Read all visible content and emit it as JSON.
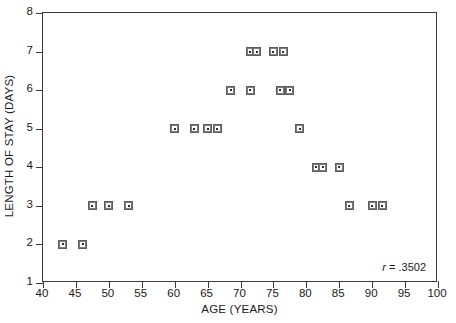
{
  "chart_data": {
    "type": "scatter",
    "title": "",
    "xlabel": "AGE (YEARS)",
    "ylabel": "LENGTH OF STAY (DAYS)",
    "xlim": [
      40,
      100
    ],
    "ylim": [
      1,
      8
    ],
    "xticks": [
      40,
      45,
      50,
      55,
      60,
      65,
      70,
      75,
      80,
      85,
      90,
      95,
      100
    ],
    "yticks": [
      1,
      2,
      3,
      4,
      5,
      6,
      7,
      8
    ],
    "xtick_labels": [
      "40",
      "45",
      "50",
      "55",
      "60",
      "65",
      "70",
      "75",
      "80",
      "85",
      "90",
      "95",
      "100"
    ],
    "ytick_labels": [
      "1",
      "2",
      "3",
      "4",
      "5",
      "6",
      "7",
      "8"
    ],
    "grid": false,
    "legend": false,
    "marker": "square-dot",
    "marker_color": "#7d7d7d",
    "frame_color": "#3a3a3a",
    "background": "#ffffff",
    "annotations": [
      {
        "text": "r = .3502",
        "symbol": "r",
        "value": ".3502",
        "position": "bottom-right"
      }
    ],
    "points": [
      {
        "x": 43,
        "y": 2
      },
      {
        "x": 46,
        "y": 2
      },
      {
        "x": 47.5,
        "y": 3
      },
      {
        "x": 50,
        "y": 3
      },
      {
        "x": 53,
        "y": 3
      },
      {
        "x": 60,
        "y": 5
      },
      {
        "x": 63,
        "y": 5
      },
      {
        "x": 65,
        "y": 5
      },
      {
        "x": 66.5,
        "y": 5
      },
      {
        "x": 68.5,
        "y": 6
      },
      {
        "x": 71.5,
        "y": 7
      },
      {
        "x": 72.5,
        "y": 7
      },
      {
        "x": 71.5,
        "y": 6
      },
      {
        "x": 75,
        "y": 7
      },
      {
        "x": 76.5,
        "y": 7
      },
      {
        "x": 76,
        "y": 6
      },
      {
        "x": 77.5,
        "y": 6
      },
      {
        "x": 79,
        "y": 5
      },
      {
        "x": 81.5,
        "y": 4
      },
      {
        "x": 82.5,
        "y": 4
      },
      {
        "x": 85,
        "y": 4
      },
      {
        "x": 86.5,
        "y": 3
      },
      {
        "x": 90,
        "y": 3
      },
      {
        "x": 91.5,
        "y": 3
      }
    ]
  }
}
